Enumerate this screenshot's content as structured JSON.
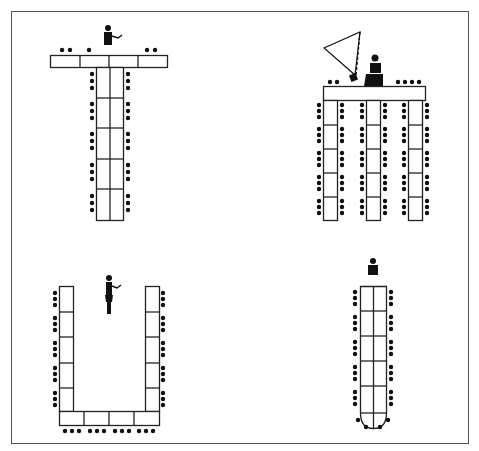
{
  "diagram": {
    "title": "",
    "colors": {
      "line": "#222222",
      "fill": "#ffffff",
      "chair": "#111111",
      "frame": "#555555"
    },
    "layouts": [
      {
        "id": "t-shape",
        "name": "T-shape layout",
        "position": "top-left",
        "presenter": "standing speaker at head",
        "head_table_segments": 4,
        "stem_segments": 5,
        "chairs_per_stem_side": 15,
        "head_chairs": 5
      },
      {
        "id": "comb",
        "name": "Comb / E-shape layout",
        "position": "top-right",
        "presenter": "seated speaker with lectern",
        "equipment": "projector with projection cone",
        "legs": 3,
        "leg_segments": 5,
        "chairs_per_leg_side": 15,
        "head_chairs": 6
      },
      {
        "id": "u-shape",
        "name": "U-shape layout",
        "position": "bottom-left",
        "presenter": "standing speaker inside U",
        "side_segments": 5,
        "bottom_segments": 4,
        "chairs_per_side": 15,
        "bottom_chairs": 12
      },
      {
        "id": "boardroom",
        "name": "Boardroom / long table layout",
        "position": "bottom-right",
        "presenter": "seated chair person at head",
        "segments": 5,
        "rounded_end": true,
        "chairs_per_side": 15,
        "end_chairs": 4
      }
    ]
  }
}
